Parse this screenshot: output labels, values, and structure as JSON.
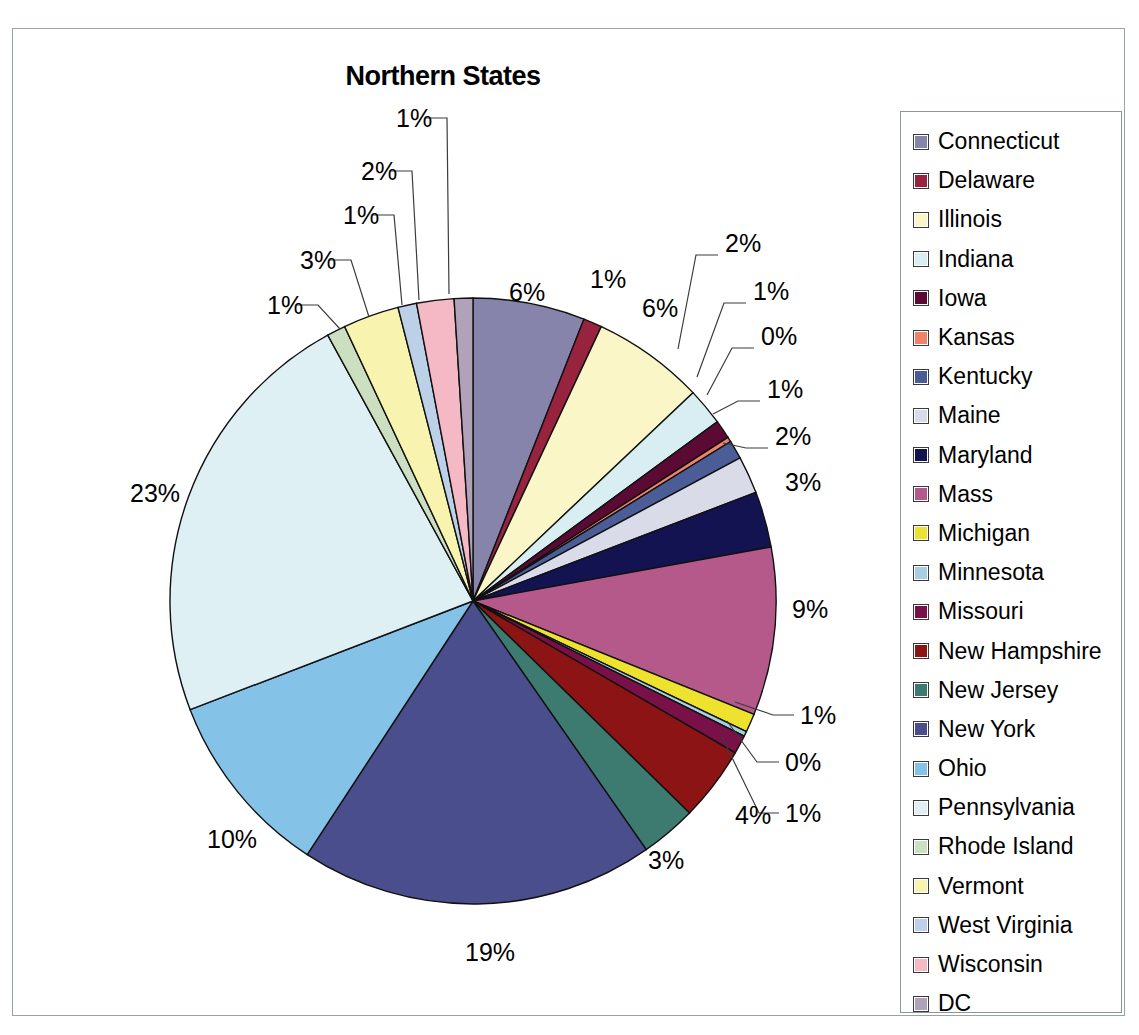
{
  "title": "Northern States",
  "chart_data": {
    "type": "pie",
    "title": "Northern States",
    "xlabel": "",
    "ylabel": "",
    "legend_position": "right",
    "grid": false,
    "label_format": "percent",
    "categories": [
      "Connecticut",
      "Delaware",
      "Illinois",
      "Indiana",
      "Iowa",
      "Kansas",
      "Kentucky",
      "Maine",
      "Maryland",
      "Mass",
      "Michigan",
      "Minnesota",
      "Missouri",
      "New Hampshire",
      "New Jersey",
      "New York",
      "Ohio",
      "Pennsylvania",
      "Rhode Island",
      "Vermont",
      "West Virginia",
      "Wisconsin",
      "DC"
    ],
    "values": [
      6,
      1,
      6,
      2,
      1,
      0,
      1,
      2,
      3,
      9,
      1,
      0,
      1,
      4,
      3,
      19,
      10,
      23,
      1,
      3,
      1,
      2,
      1
    ],
    "value_labels": [
      "6%",
      "1%",
      "6%",
      "2%",
      "1%",
      "0%",
      "1%",
      "2%",
      "3%",
      "9%",
      "1%",
      "0%",
      "1%",
      "4%",
      "3%",
      "19%",
      "10%",
      "23%",
      "1%",
      "3%",
      "1%",
      "2%",
      "1%"
    ],
    "colors": [
      "#8784ab",
      "#97233f",
      "#fbf6c8",
      "#d9eef2",
      "#5b0b33",
      "#f0826a",
      "#4a5d96",
      "#dadbe8",
      "#131352",
      "#b5588a",
      "#ede32e",
      "#a6cfe0",
      "#7a1048",
      "#8c1414",
      "#3d7a70",
      "#4a4e8c",
      "#84c2e8",
      "#dff0f5",
      "#ccdfc0",
      "#f8f4b0",
      "#bcd0e8",
      "#f4b9c4",
      "#b0a2b8"
    ]
  },
  "legend": {
    "items": [
      {
        "label": "Connecticut",
        "color": "#8784ab"
      },
      {
        "label": "Delaware",
        "color": "#97233f"
      },
      {
        "label": "Illinois",
        "color": "#fbf6c8"
      },
      {
        "label": "Indiana",
        "color": "#d9eef2"
      },
      {
        "label": "Iowa",
        "color": "#5b0b33"
      },
      {
        "label": "Kansas",
        "color": "#f0826a"
      },
      {
        "label": "Kentucky",
        "color": "#4a5d96"
      },
      {
        "label": "Maine",
        "color": "#dadbe8"
      },
      {
        "label": "Maryland",
        "color": "#131352"
      },
      {
        "label": "Mass",
        "color": "#b5588a"
      },
      {
        "label": "Michigan",
        "color": "#ede32e"
      },
      {
        "label": "Minnesota",
        "color": "#a6cfe0"
      },
      {
        "label": "Missouri",
        "color": "#7a1048"
      },
      {
        "label": "New Hampshire",
        "color": "#8c1414"
      },
      {
        "label": "New Jersey",
        "color": "#3d7a70"
      },
      {
        "label": "New York",
        "color": "#4a4e8c"
      },
      {
        "label": "Ohio",
        "color": "#84c2e8"
      },
      {
        "label": "Pennsylvania",
        "color": "#dff0f5"
      },
      {
        "label": "Rhode Island",
        "color": "#ccdfc0"
      },
      {
        "label": "Vermont",
        "color": "#f8f4b0"
      },
      {
        "label": "West Virginia",
        "color": "#bcd0e8"
      },
      {
        "label": "Wisconsin",
        "color": "#f4b9c4"
      },
      {
        "label": "DC",
        "color": "#b0a2b8"
      }
    ]
  },
  "pie_labels": [
    {
      "text": "6%",
      "x": 496,
      "y": 251,
      "leader": null
    },
    {
      "text": "1%",
      "x": 577,
      "y": 238,
      "leader": null
    },
    {
      "text": "6%",
      "x": 629,
      "y": 267,
      "leader": null
    },
    {
      "text": "2%",
      "x": 712,
      "y": 202,
      "leader": [
        [
          705,
          226
        ],
        [
          683,
          226
        ],
        [
          665,
          320
        ]
      ]
    },
    {
      "text": "1%",
      "x": 740,
      "y": 250,
      "leader": [
        [
          733,
          274
        ],
        [
          711,
          274
        ],
        [
          684,
          348
        ]
      ]
    },
    {
      "text": "0%",
      "x": 748,
      "y": 295,
      "leader": [
        [
          741,
          319
        ],
        [
          719,
          319
        ],
        [
          694,
          366
        ]
      ]
    },
    {
      "text": "1%",
      "x": 754,
      "y": 348,
      "leader": [
        [
          747,
          372
        ],
        [
          725,
          372
        ],
        [
          700,
          385
        ]
      ]
    },
    {
      "text": "2%",
      "x": 762,
      "y": 395,
      "leader": [
        [
          755,
          419
        ],
        [
          733,
          419
        ],
        [
          710,
          414
        ]
      ]
    },
    {
      "text": "3%",
      "x": 772,
      "y": 441,
      "leader": null
    },
    {
      "text": "9%",
      "x": 779,
      "y": 568,
      "leader": null
    },
    {
      "text": "1%",
      "x": 787,
      "y": 674,
      "leader": [
        [
          781,
          686
        ],
        [
          760,
          686
        ],
        [
          722,
          673
        ]
      ]
    },
    {
      "text": "0%",
      "x": 772,
      "y": 721,
      "leader": [
        [
          766,
          733
        ],
        [
          744,
          733
        ],
        [
          714,
          692
        ]
      ]
    },
    {
      "text": "1%",
      "x": 772,
      "y": 772,
      "leader": [
        [
          766,
          784
        ],
        [
          746,
          784
        ],
        [
          708,
          706
        ]
      ]
    },
    {
      "text": "4%",
      "x": 722,
      "y": 774,
      "leader": null
    },
    {
      "text": "3%",
      "x": 635,
      "y": 819,
      "leader": null
    },
    {
      "text": "19%",
      "x": 452,
      "y": 911,
      "leader": null
    },
    {
      "text": "10%",
      "x": 194,
      "y": 798,
      "leader": null
    },
    {
      "text": "23%",
      "x": 117,
      "y": 452,
      "leader": null
    },
    {
      "text": "1%",
      "x": 254,
      "y": 264,
      "leader": [
        [
          283,
          276
        ],
        [
          305,
          276
        ],
        [
          327,
          300
        ]
      ]
    },
    {
      "text": "3%",
      "x": 287,
      "y": 219,
      "leader": [
        [
          316,
          231
        ],
        [
          338,
          231
        ],
        [
          356,
          288
        ]
      ]
    },
    {
      "text": "1%",
      "x": 330,
      "y": 174,
      "leader": [
        [
          359,
          186
        ],
        [
          381,
          186
        ],
        [
          389,
          276
        ]
      ]
    },
    {
      "text": "2%",
      "x": 348,
      "y": 130,
      "leader": [
        [
          377,
          142
        ],
        [
          399,
          142
        ],
        [
          406,
          271
        ]
      ]
    },
    {
      "text": "1%",
      "x": 383,
      "y": 77,
      "leader": [
        [
          412,
          89
        ],
        [
          434,
          89
        ],
        [
          436,
          265
        ]
      ]
    }
  ],
  "geometry": {
    "center_x": 460,
    "center_y": 572,
    "radius": 303,
    "start_angle_deg": -90
  }
}
